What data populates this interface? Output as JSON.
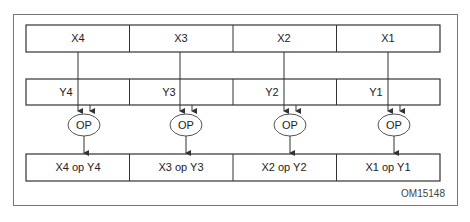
{
  "diagram": {
    "x_row": [
      "X4",
      "X3",
      "X2",
      "X1"
    ],
    "y_row": [
      "Y4",
      "Y3",
      "Y2",
      "Y1"
    ],
    "op_label": "OP",
    "result_row": [
      "X4 op Y4",
      "X3 op Y3",
      "X2 op Y2",
      "X1 op Y1"
    ],
    "figure_id": "OM15148"
  },
  "colors": {
    "line": "#333333",
    "frame": "#666666",
    "background": "#ffffff"
  }
}
